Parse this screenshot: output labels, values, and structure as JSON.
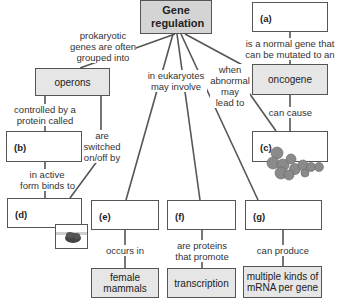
{
  "title": "Gene regulation",
  "nodes": {
    "a": {
      "label": "(a)"
    },
    "oncogene": {
      "text": "oncogene"
    },
    "c": {
      "label": "(c)"
    },
    "operons": {
      "text": "operons"
    },
    "b": {
      "label": "(b)"
    },
    "d": {
      "label": "(d)"
    },
    "e": {
      "label": "(e)"
    },
    "f": {
      "label": "(f)"
    },
    "g": {
      "label": "(g)"
    },
    "female_mammals": {
      "line1": "female",
      "line2": "mammals"
    },
    "transcription": {
      "text": "transcription"
    },
    "mrna": {
      "line1": "multiple kinds of",
      "line2": "mRNA per gene"
    }
  },
  "links": {
    "prokaryotic": [
      "prokaryotic",
      "genes are often",
      "grouped into"
    ],
    "eukaryotes": [
      "in eukaryotes",
      "may involve"
    ],
    "abnormal": [
      "when",
      "abnormal",
      "may",
      "lead to"
    ],
    "normal_gene": [
      "is a normal gene that",
      "can be mutated to an"
    ],
    "can_cause": [
      "can cause"
    ],
    "controlled": [
      "controlled by a",
      "protein called"
    ],
    "switched": [
      "are",
      "switched",
      "on/off by"
    ],
    "active_form": [
      "in active",
      "form binds to"
    ],
    "occurs_in": [
      "occurs in"
    ],
    "proteins_promote": [
      "are proteins",
      "that promote"
    ],
    "can_produce": [
      "can produce"
    ]
  },
  "colors": {
    "line": "#555555",
    "title_fill": "#d4d4d4",
    "box_fill": "#e6e6e6",
    "tumor": "#8a8a8a"
  }
}
